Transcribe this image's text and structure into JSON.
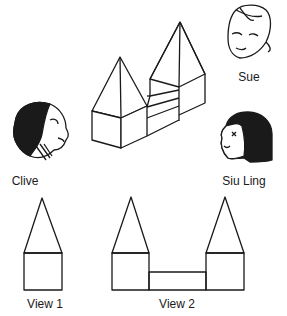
{
  "figure": {
    "characters": [
      {
        "name": "Sue",
        "position": "top-right"
      },
      {
        "name": "Clive",
        "position": "left"
      },
      {
        "name": "Siu Ling",
        "position": "right"
      }
    ],
    "solid": "Two square-based towers with pyramid roofs joined by a low rectangular block",
    "views": [
      {
        "label": "View 1"
      },
      {
        "label": "View 2"
      }
    ]
  },
  "colors": {
    "ink": "#1a1a1a",
    "background": "#ffffff"
  }
}
